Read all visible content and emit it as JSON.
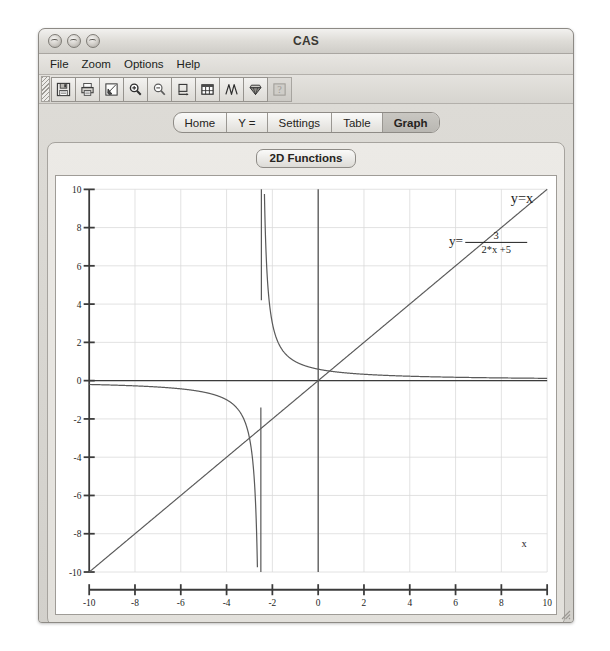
{
  "window": {
    "title": "CAS",
    "traffic_lights": [
      "close-button",
      "minimize-button",
      "zoom-button"
    ]
  },
  "menu_bar": {
    "items": [
      {
        "label": "File"
      },
      {
        "label": "Zoom"
      },
      {
        "label": "Options"
      },
      {
        "label": "Help"
      }
    ]
  },
  "toolbar": {
    "buttons": [
      {
        "icon": "save-icon",
        "title": "Save"
      },
      {
        "icon": "print-icon",
        "title": "Print"
      },
      {
        "icon": "pointer-edit-icon",
        "title": "Select"
      },
      {
        "icon": "zoom-in-icon",
        "title": "Zoom In"
      },
      {
        "icon": "zoom-out-icon",
        "title": "Zoom Out"
      },
      {
        "icon": "crop-region-icon",
        "title": "Zoom Box"
      },
      {
        "icon": "table-icon",
        "title": "Table"
      },
      {
        "icon": "wave-function-icon",
        "title": "Function"
      },
      {
        "icon": "gem-icon",
        "title": "Evaluate"
      },
      {
        "icon": "help-icon",
        "title": "Help",
        "disabled": true
      }
    ]
  },
  "tabs": [
    {
      "label": "Home",
      "selected": false
    },
    {
      "label": "Y =",
      "selected": false
    },
    {
      "label": "Settings",
      "selected": false
    },
    {
      "label": "Table",
      "selected": false
    },
    {
      "label": "Graph",
      "selected": true
    }
  ],
  "graph_panel": {
    "title": "2D Functions"
  },
  "chart_data": {
    "type": "line",
    "title": "2D Functions",
    "xlabel": "x",
    "ylabel": "",
    "xlim": [
      -10,
      10
    ],
    "ylim": [
      -10,
      10
    ],
    "grid": true,
    "xticks": [
      -10,
      -8,
      -6,
      -4,
      -2,
      0,
      2,
      4,
      6,
      8,
      10
    ],
    "yticks": [
      10,
      8,
      6,
      4,
      2,
      0,
      -2,
      -4,
      -6,
      -8,
      -10
    ],
    "xtick_labels": [
      "-10",
      "-8",
      "-6",
      "-4",
      "-2",
      "0",
      "2",
      "4",
      "6",
      "8",
      "10"
    ],
    "ytick_labels": [
      "10",
      "8",
      "6",
      "4",
      "2",
      "0",
      "-2",
      "-4",
      "-6",
      "-8",
      "-10"
    ],
    "series": [
      {
        "name": "y=x",
        "expression": "x",
        "label": "y=x",
        "label_x": 8.9,
        "label_y": 9.3,
        "color": "#555555"
      },
      {
        "name": "y=3/(2*x+5)",
        "expression": "3/(2*x+5)",
        "label_prefix": "y=",
        "label_numerator": "3",
        "label_denominator": "2*x +5",
        "label_x": 7.1,
        "label_y": 7.6,
        "asymptote_x": -2.5,
        "color": "#555555"
      }
    ],
    "axis_label_x": "x",
    "axis_label_x_pos": [
      9.0,
      -8.7
    ],
    "axis_color": "#3b3b3b",
    "grid_color": "#d9d9d9",
    "curve_color": "#5a5a5a"
  }
}
